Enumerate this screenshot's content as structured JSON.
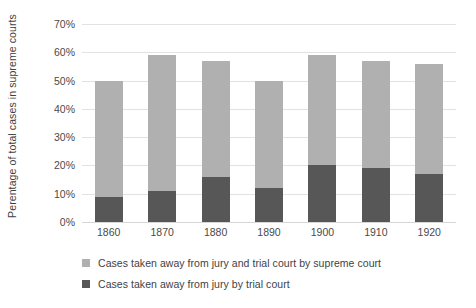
{
  "chart_data": {
    "type": "bar",
    "subtype": "stacked-column",
    "title": "",
    "xlabel": "",
    "ylabel": "Perentage of total cases in supreme courts",
    "categories": [
      "1860",
      "1870",
      "1880",
      "1890",
      "1900",
      "1910",
      "1920"
    ],
    "series": [
      {
        "name": "Cases taken away from jury by trial court",
        "color": "#575757",
        "stack_order": 0,
        "values": [
          9,
          11,
          16,
          12,
          20,
          19,
          17
        ]
      },
      {
        "name": "Cases taken away from jury and trial court by supreme court",
        "color": "#b0b0b0",
        "stack_order": 1,
        "values": [
          41,
          48,
          41,
          38,
          39,
          38,
          39
        ]
      }
    ],
    "totals": [
      50,
      59,
      57,
      50,
      59,
      57,
      56
    ],
    "ylim": [
      0,
      70
    ],
    "ytick_values": [
      0,
      10,
      20,
      30,
      40,
      50,
      60,
      70
    ],
    "ytick_labels": [
      "0%",
      "10%",
      "20%",
      "30%",
      "40%",
      "50%",
      "60%",
      "70%"
    ],
    "grid": true,
    "legend_position": "bottom-left",
    "legend": [
      "Cases taken away from jury and trial court by supreme court",
      "Cases taken away from jury by trial court"
    ],
    "colors": {
      "light_series": "#b0b0b0",
      "dark_series": "#575757",
      "gridline": "#e2e2e2",
      "text": "#3f3f3f",
      "background": "#ffffff"
    }
  }
}
